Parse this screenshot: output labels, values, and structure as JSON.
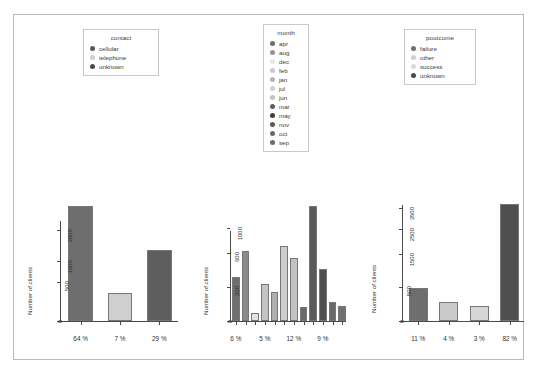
{
  "figure": {
    "background": "#ffffff",
    "border_color": "#b9b9b9",
    "axis_color": "#4a4a4a",
    "ylabel": "Number of clients"
  },
  "legends": [
    {
      "name": "contact",
      "title": "contact",
      "items": [
        {
          "label": "cellular",
          "color": "#595959"
        },
        {
          "label": "telephone",
          "color": "#cfcfcf"
        },
        {
          "label": "unknown",
          "color": "#4a4a4a"
        }
      ]
    },
    {
      "name": "month",
      "title": "month",
      "items": [
        {
          "label": "apr",
          "color": "#6e6e6e"
        },
        {
          "label": "aug",
          "color": "#949494"
        },
        {
          "label": "dec",
          "color": "#e8e8e8"
        },
        {
          "label": "feb",
          "color": "#c9c9c9"
        },
        {
          "label": "jan",
          "color": "#b5b5b5"
        },
        {
          "label": "jul",
          "color": "#cfcfcf"
        },
        {
          "label": "jun",
          "color": "#c2c2c2"
        },
        {
          "label": "mar",
          "color": "#5e5e5e"
        },
        {
          "label": "may",
          "color": "#3d3d3d"
        },
        {
          "label": "nov",
          "color": "#595959"
        },
        {
          "label": "oct",
          "color": "#6b6b6b"
        },
        {
          "label": "sep",
          "color": "#6b6b6b"
        }
      ]
    },
    {
      "name": "poutcome",
      "title": "poutcome",
      "items": [
        {
          "label": "failure",
          "color": "#6e6e6e"
        },
        {
          "label": "other",
          "color": "#cfcfcf"
        },
        {
          "label": "success",
          "color": "#dcdcdc"
        },
        {
          "label": "unknown",
          "color": "#4a4a4a"
        }
      ]
    }
  ],
  "chart_data": [
    {
      "type": "bar",
      "name": "contact",
      "title": "",
      "xlabel": "",
      "ylabel": "Number of clients",
      "categories": [
        "cellular",
        "telephone",
        "unknown"
      ],
      "values": [
        2896,
        301,
        1324
      ],
      "percent_labels": [
        "64 %",
        "7 %",
        "29 %"
      ],
      "colors": [
        "#6e6e6e",
        "#cfcfcf",
        "#5e5e5e"
      ],
      "yticks": [
        0,
        500,
        1000,
        2000
      ],
      "ylim": [
        0,
        3100
      ],
      "grid": false
    },
    {
      "type": "bar",
      "name": "month",
      "title": "",
      "xlabel": "",
      "ylabel": "Number of clients",
      "categories": [
        "apr",
        "aug",
        "dec",
        "feb",
        "jan",
        "jul",
        "jun",
        "mar",
        "may",
        "nov",
        "oct",
        "sep"
      ],
      "values": [
        293,
        633,
        20,
        222,
        148,
        706,
        531,
        49,
        1398,
        389,
        80,
        52
      ],
      "percent_labels": [
        "6 %",
        "5 %",
        "12 %",
        "9 %"
      ],
      "percent_label_indices": [
        0,
        3,
        6,
        9
      ],
      "colors": [
        "#6e6e6e",
        "#8a8a8a",
        "#e2e2e2",
        "#c4c4c4",
        "#b0b0b0",
        "#cdcdcd",
        "#c2c2c2",
        "#6a6a6a",
        "#5a5a5a",
        "#4f4f4f",
        "#6b6b6b",
        "#707070"
      ],
      "yticks": [
        0,
        200,
        600,
        1000
      ],
      "ylim": [
        0,
        1500
      ],
      "grid": false
    },
    {
      "type": "bar",
      "name": "poutcome",
      "title": "",
      "xlabel": "",
      "ylabel": "Number of clients",
      "categories": [
        "failure",
        "other",
        "success",
        "unknown"
      ],
      "values": [
        490,
        197,
        129,
        3705
      ],
      "percent_labels": [
        "11 %",
        "4 %",
        "3 %",
        "82 %"
      ],
      "colors": [
        "#6e6e6e",
        "#cacaca",
        "#d6d6d6",
        "#4f4f4f"
      ],
      "yticks": [
        0,
        500,
        1500,
        2500,
        3500
      ],
      "ylim": [
        0,
        3850
      ],
      "grid": false
    }
  ]
}
